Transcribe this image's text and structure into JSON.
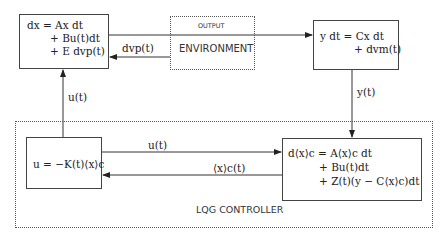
{
  "plant": {
    "line1": "dx = Ax dt",
    "line2": "+ Bu(t)dt",
    "line3": "+ E dvp(t)"
  },
  "environment": {
    "output_label": "OUTPUT",
    "title": "ENVIRONMENT"
  },
  "measurement": {
    "line1": "y dt = Cx dt",
    "line2": "+ dvm(t)"
  },
  "signals": {
    "process_noise": "dvp(t)",
    "control_up": "u(t)",
    "measurement_down": "y(t)",
    "control_right": "u(t)",
    "estimate_left": "⟨x⟩c(t)"
  },
  "controller": {
    "title": "LQG CONTROLLER",
    "feedback": "u = −K(t)⟨x⟩c",
    "estimator_line1": "d⟨x⟩c = A⟨x⟩c dt",
    "estimator_line2": "+ Bu(t)dt",
    "estimator_line3": "+ Z(t)(y − C⟨x⟩c)dt"
  }
}
